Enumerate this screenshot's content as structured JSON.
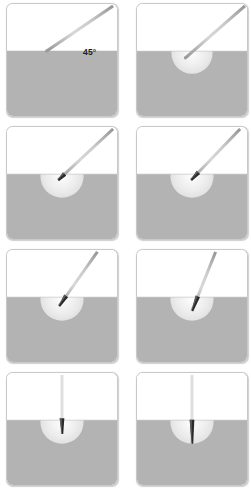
{
  "figure": {
    "colors": {
      "background": "#ffffff",
      "panel_border": "#c9c9c9",
      "tissue_gray": "#b3b3b3",
      "air_white": "#ffffff",
      "halo_light": "#ececec",
      "needle_shaft_light": "#e3e3e3",
      "needle_shaft_dark": "#9a9a9a",
      "needle_tip_dark": "#2b2b2b",
      "label_text": "#1c1c1c"
    },
    "geometry": {
      "panel_width": 112,
      "panel_height": 114,
      "surface_line_y": 48,
      "halo_center_x": 56,
      "halo_radius": 22
    },
    "panels": [
      {
        "id": "panel-1",
        "row": 1,
        "column": 1,
        "caption": "",
        "angle_label": "45°",
        "angle_degrees": 45,
        "needle_angle_from_surface": 45,
        "needle_tip_x": 40,
        "needle_tip_y": 48,
        "needle_top_x": 108,
        "needle_top_y": 2,
        "penetration_depth": 0,
        "halo_radius": 0,
        "has_halo": false,
        "tip_dark": false,
        "label_left": 76,
        "label_top": 43
      },
      {
        "id": "panel-2",
        "row": 1,
        "column": 2,
        "caption": "",
        "angle_label": "",
        "angle_degrees": 45,
        "needle_angle_from_surface": 45,
        "needle_tip_x": 49,
        "needle_tip_y": 55,
        "needle_top_x": 110,
        "needle_top_y": 2,
        "penetration_depth": 7,
        "halo_radius": 21,
        "has_halo": true,
        "tip_dark": false,
        "label_left": 0,
        "label_top": 0
      },
      {
        "id": "panel-3",
        "row": 2,
        "column": 1,
        "caption": "",
        "angle_label": "",
        "angle_degrees": 45,
        "needle_angle_from_surface": 45,
        "needle_tip_x": 52,
        "needle_tip_y": 54,
        "needle_top_x": 108,
        "needle_top_y": 2,
        "penetration_depth": 6,
        "halo_radius": 22,
        "has_halo": true,
        "tip_dark": true,
        "label_left": 0,
        "label_top": 0
      },
      {
        "id": "panel-4",
        "row": 2,
        "column": 2,
        "caption": "",
        "angle_label": "",
        "angle_degrees": 55,
        "needle_angle_from_surface": 55,
        "needle_tip_x": 55,
        "needle_tip_y": 54,
        "needle_top_x": 105,
        "needle_top_y": 2,
        "penetration_depth": 8,
        "halo_radius": 22,
        "has_halo": true,
        "tip_dark": true,
        "label_left": 0,
        "label_top": 0
      },
      {
        "id": "panel-5",
        "row": 3,
        "column": 1,
        "caption": "",
        "angle_label": "",
        "angle_degrees": 65,
        "needle_angle_from_surface": 65,
        "needle_tip_x": 53,
        "needle_tip_y": 57,
        "needle_top_x": 92,
        "needle_top_y": 2,
        "penetration_depth": 10,
        "halo_radius": 22,
        "has_halo": true,
        "tip_dark": true,
        "label_left": 0,
        "label_top": 0
      },
      {
        "id": "panel-6",
        "row": 3,
        "column": 2,
        "caption": "",
        "angle_label": "",
        "angle_degrees": 75,
        "needle_angle_from_surface": 75,
        "needle_tip_x": 56,
        "needle_tip_y": 62,
        "needle_top_x": 80,
        "needle_top_y": 2,
        "penetration_depth": 14,
        "halo_radius": 22,
        "has_halo": true,
        "tip_dark": true,
        "label_left": 0,
        "label_top": 0
      },
      {
        "id": "panel-7",
        "row": 4,
        "column": 1,
        "caption": "",
        "angle_label": "",
        "angle_degrees": 90,
        "needle_angle_from_surface": 90,
        "needle_tip_x": 56,
        "needle_tip_y": 62,
        "needle_top_x": 56,
        "needle_top_y": 2,
        "penetration_depth": 14,
        "halo_radius": 22,
        "has_halo": true,
        "tip_dark": true,
        "label_left": 0,
        "label_top": 0
      },
      {
        "id": "panel-8",
        "row": 4,
        "column": 2,
        "caption": "",
        "angle_label": "",
        "angle_degrees": 90,
        "needle_angle_from_surface": 90,
        "needle_tip_x": 56,
        "needle_tip_y": 72,
        "needle_top_x": 56,
        "needle_top_y": 2,
        "penetration_depth": 24,
        "halo_radius": 22,
        "has_halo": true,
        "tip_dark": true,
        "label_left": 0,
        "label_top": 0
      }
    ]
  }
}
